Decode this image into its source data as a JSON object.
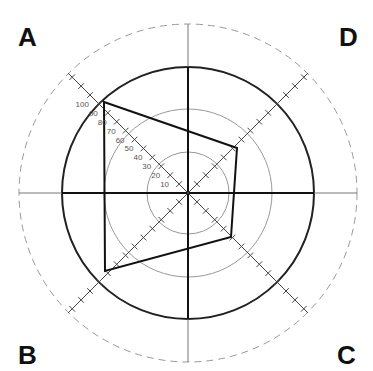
{
  "corners": {
    "a": "A",
    "b": "B",
    "c": "C",
    "d": "D"
  },
  "scale": {
    "ticks": [
      "10",
      "20",
      "30",
      "40",
      "50",
      "60",
      "70",
      "80",
      "90",
      "100"
    ]
  },
  "chart_data": {
    "type": "radar",
    "title": "",
    "axes": [
      "A",
      "B",
      "C",
      "D"
    ],
    "range": [
      0,
      100
    ],
    "tick_labels": [
      10,
      20,
      30,
      40,
      50,
      60,
      70,
      80,
      90,
      100
    ],
    "values": {
      "A": 100,
      "B": 75,
      "C": 50,
      "D": 65
    },
    "rings": {
      "inner": 33,
      "middle": 67,
      "solid_outer": 100,
      "dashed": 135
    }
  }
}
